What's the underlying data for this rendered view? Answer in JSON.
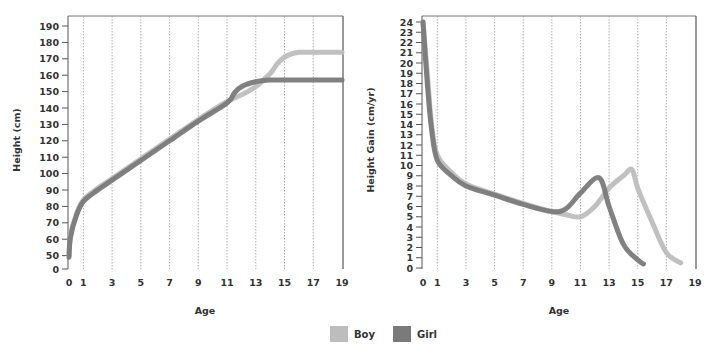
{
  "colors": {
    "boy": "#bdbdbd",
    "girl": "#7a7a7a",
    "axis": "#555555",
    "grid": "#9a9a9a"
  },
  "legend": [
    {
      "label": "Boy",
      "color": "#bdbdbd"
    },
    {
      "label": "Girl",
      "color": "#7a7a7a"
    }
  ],
  "chart_data": [
    {
      "type": "line",
      "title": "",
      "xlabel": "Age",
      "ylabel": "Height (cm)",
      "x_ticks": [
        0,
        1,
        3,
        5,
        7,
        9,
        11,
        13,
        15,
        17,
        19
      ],
      "y_ticks": [
        0,
        50,
        60,
        70,
        80,
        90,
        100,
        110,
        120,
        130,
        140,
        150,
        160,
        170,
        180,
        190
      ],
      "xlim": [
        0,
        19
      ],
      "ylim": [
        0,
        190
      ],
      "grid": "vertical dotted",
      "legend_position": "bottom center",
      "series": [
        {
          "name": "Boy",
          "x": [
            0,
            0.1,
            0.5,
            1,
            2,
            3,
            5,
            7,
            9,
            11,
            12,
            13,
            14,
            14.5,
            15,
            15.5,
            16,
            17,
            19
          ],
          "y": [
            50,
            62,
            75,
            84,
            91,
            97,
            109,
            121,
            133,
            144,
            148,
            153,
            161,
            167,
            171,
            173,
            174,
            174,
            174
          ]
        },
        {
          "name": "Girl",
          "x": [
            0,
            0.1,
            0.5,
            1,
            2,
            3,
            5,
            7,
            9,
            11,
            11.5,
            12,
            13,
            14,
            15,
            17,
            19
          ],
          "y": [
            49,
            61,
            74,
            83,
            90,
            96,
            108,
            120,
            132,
            143,
            149,
            153,
            156,
            157,
            157,
            157,
            157
          ]
        }
      ]
    },
    {
      "type": "line",
      "title": "",
      "xlabel": "Age",
      "ylabel": "Height Gain (cm/yr)",
      "x_ticks": [
        0,
        1,
        3,
        5,
        7,
        9,
        11,
        13,
        15,
        17,
        19
      ],
      "y_ticks": [
        0,
        1,
        2,
        3,
        4,
        5,
        6,
        7,
        8,
        9,
        10,
        11,
        12,
        13,
        14,
        15,
        16,
        17,
        18,
        19,
        20,
        21,
        22,
        23,
        24
      ],
      "xlim": [
        0,
        19
      ],
      "ylim": [
        0,
        24
      ],
      "grid": "vertical dotted",
      "legend_position": "bottom center",
      "series": [
        {
          "name": "Boy",
          "x": [
            0,
            0.3,
            0.6,
            1,
            2,
            3,
            5,
            7,
            9,
            10,
            11,
            12,
            13,
            14,
            14.6,
            15,
            16,
            17,
            18
          ],
          "y": [
            24,
            19,
            14,
            11,
            9.3,
            8.2,
            7.2,
            6.3,
            5.5,
            5.2,
            5.0,
            6.0,
            7.8,
            9.0,
            9.6,
            7.8,
            4.5,
            1.5,
            0.5
          ]
        },
        {
          "name": "Girl",
          "x": [
            0,
            0.3,
            0.6,
            1,
            2,
            3,
            5,
            7,
            9,
            10,
            11,
            12.3,
            13,
            14,
            15,
            15.4
          ],
          "y": [
            24,
            18,
            13.5,
            10.5,
            9,
            8,
            7.1,
            6.2,
            5.5,
            5.8,
            7.3,
            8.8,
            6.0,
            2.3,
            0.8,
            0.4
          ]
        }
      ]
    }
  ]
}
